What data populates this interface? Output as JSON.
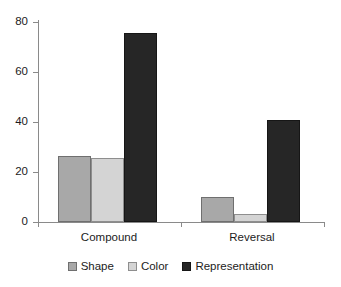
{
  "chart_data": {
    "type": "bar",
    "title": "",
    "subtitle": "",
    "xlabel": "",
    "ylabel": "",
    "categories": [
      "Compound",
      "Reversal"
    ],
    "series": [
      {
        "name": "Shape",
        "values": [
          26,
          10
        ],
        "color": "#a8a8a8"
      },
      {
        "name": "Color",
        "values": [
          25,
          3
        ],
        "color": "#d4d4d4"
      },
      {
        "name": "Representation",
        "values": [
          74,
          40
        ],
        "color": "#262626"
      }
    ],
    "ylim": [
      0,
      80
    ],
    "yticks": [
      0,
      20,
      40,
      60,
      80
    ],
    "ytick_labels": [
      "0",
      "20",
      "40",
      "60",
      "80"
    ],
    "grid": false,
    "legend_position": "bottom",
    "annotations": []
  },
  "axes": {
    "y": {
      "labels": [
        "80",
        "60",
        "40",
        "20",
        "0"
      ]
    },
    "x": {
      "labels": [
        "Compound",
        "Reversal"
      ]
    }
  },
  "legend": {
    "items": [
      {
        "label": "Shape",
        "swatch": "shape-swatch"
      },
      {
        "label": "Color",
        "swatch": "color-swatch"
      },
      {
        "label": "Representation",
        "swatch": "representation-swatch"
      }
    ]
  }
}
